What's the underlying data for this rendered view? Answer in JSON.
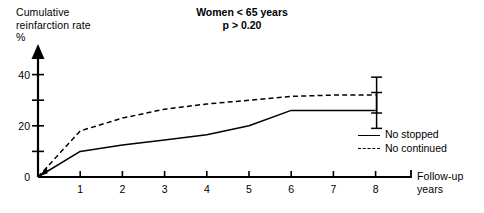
{
  "chart_data": {
    "type": "line",
    "title": "Women < 65 years",
    "subtitle": "p > 0.20",
    "xlabel": "Follow-up\nyears",
    "ylabel": "Cumulative\nreinfarction rate\n%",
    "xlim": [
      0,
      8.6
    ],
    "ylim": [
      0,
      45
    ],
    "xticks": [
      "1",
      "2",
      "3",
      "4",
      "5",
      "6",
      "7",
      "8"
    ],
    "xtick_values": [
      1,
      2,
      3,
      4,
      5,
      6,
      7,
      8
    ],
    "yticks": [
      "0",
      "20",
      "40"
    ],
    "ytick_values": [
      0,
      20,
      40
    ],
    "yminor_values": [
      10,
      30
    ],
    "grid": false,
    "legend_position": "right",
    "x": [
      0,
      1,
      2,
      3,
      4,
      5,
      6,
      7,
      8
    ],
    "series": [
      {
        "name": "No stopped",
        "style": "solid",
        "values": [
          0,
          10,
          12.5,
          14.5,
          16.5,
          20,
          26,
          26,
          26
        ],
        "error_bar": {
          "x": 8,
          "low": 19,
          "high": 33
        }
      },
      {
        "name": "No continued",
        "style": "dashed",
        "values": [
          0,
          18,
          23,
          26.5,
          28.5,
          30,
          31.5,
          32,
          32
        ],
        "error_bar": {
          "x": 8,
          "low": 25,
          "high": 39
        }
      }
    ]
  },
  "axes": {
    "y_title_lines": [
      "Cumulative",
      "reinfarction rate",
      "%"
    ],
    "x_title_lines": [
      "Follow-up",
      "years"
    ]
  },
  "legend": {
    "items": [
      {
        "label": "No stopped",
        "style": "solid"
      },
      {
        "label": "No continued",
        "style": "dashed"
      }
    ]
  },
  "colors": {
    "ink": "#000000",
    "background": "#ffffff"
  }
}
